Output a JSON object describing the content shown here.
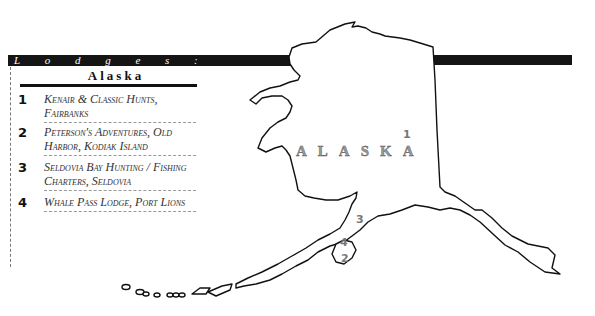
{
  "header": {
    "title": "L o d g e s :",
    "region": "Alaska"
  },
  "lodges": [
    {
      "number": "1",
      "name": "Kenair & Classic Hunts, Fairbanks"
    },
    {
      "number": "2",
      "name": "Peterson's Adventures, Old Harbor, Kodiak Island"
    },
    {
      "number": "3",
      "name": "Seldovia Bay Hunting / Fishing Charters, Seldovia"
    },
    {
      "number": "4",
      "name": "Whale Pass Lodge, Port Lions"
    }
  ],
  "map": {
    "label": "ALASKA",
    "markers": [
      {
        "number": "1",
        "x": 404,
        "y": 130
      },
      {
        "number": "2",
        "x": 341,
        "y": 253
      },
      {
        "number": "3",
        "x": 356,
        "y": 214
      },
      {
        "number": "4",
        "x": 341,
        "y": 238
      }
    ],
    "colors": {
      "bar": "#151515",
      "outline": "#111111",
      "marker": "#777777"
    }
  }
}
